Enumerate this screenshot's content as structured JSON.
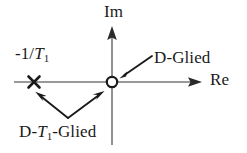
{
  "figure": {
    "kind": "pole-zero-plot",
    "background_color": "#ffffff",
    "axis_color": "#777777",
    "marker_color": "#1a1a1a",
    "text_color": "#1a1a1a",
    "width": 247,
    "height": 153
  },
  "axes": {
    "imaginary": {
      "label": "Im",
      "orientation": "vertical",
      "x": 112,
      "y_top": 28,
      "y_bottom": 145,
      "arrow": "up"
    },
    "real": {
      "label": "Re",
      "orientation": "horizontal",
      "y": 82,
      "x_left": 14,
      "x_right": 200,
      "arrow": "right"
    },
    "origin": {
      "x": 112,
      "y": 82
    }
  },
  "markers": [
    {
      "name": "pole-cross",
      "glyph": "x",
      "type": "pole",
      "x": 34,
      "y": 82,
      "label": "-1/T₁",
      "label_parts": {
        "prefix": "-1/",
        "variable": "T",
        "subscript": "1"
      }
    },
    {
      "name": "zero-circle",
      "glyph": "o",
      "type": "zero",
      "x": 112,
      "y": 82,
      "label": ""
    }
  ],
  "annotations": [
    {
      "name": "d-glied",
      "text": "D-Glied",
      "text_plain": "D-Glied",
      "label_x": 154,
      "label_y": 48,
      "arrow_from": {
        "x": 152,
        "y": 57
      },
      "arrow_to": {
        "x": 120,
        "y": 78
      },
      "points_at": "zero-circle"
    },
    {
      "name": "d-t1-glied",
      "text": "D-T₁-Glied",
      "text_parts": {
        "prefix": "D-",
        "variable": "T",
        "subscript": "1",
        "suffix": "-Glied"
      },
      "label_x": 19,
      "label_y": 122,
      "arrows": [
        {
          "from": {
            "x": 68,
            "y": 119
          },
          "to": {
            "x": 32,
            "y": 90
          },
          "points_at": "pole-cross"
        },
        {
          "from": {
            "x": 68,
            "y": 119
          },
          "to": {
            "x": 106,
            "y": 88
          },
          "points_at": "zero-circle"
        }
      ]
    }
  ]
}
